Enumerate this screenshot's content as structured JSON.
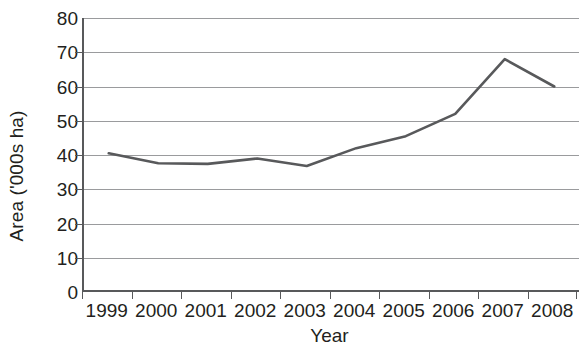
{
  "chart_data": {
    "type": "line",
    "title": "",
    "xlabel": "Year",
    "ylabel": "Area ('000s ha)",
    "categories": [
      "1999",
      "2000",
      "2001",
      "2002",
      "2003",
      "2004",
      "2005",
      "2006",
      "2007",
      "2008"
    ],
    "values": [
      40.5,
      37.6,
      37.4,
      39.0,
      36.8,
      42.0,
      45.5,
      52.0,
      68.0,
      60.0
    ],
    "series": [
      {
        "name": "Area",
        "values": [
          40.5,
          37.6,
          37.4,
          39.0,
          36.8,
          42.0,
          45.5,
          52.0,
          68.0,
          60.0
        ],
        "color": "#58595b"
      }
    ],
    "ylim": [
      0,
      80
    ],
    "y_ticks": [
      0,
      10,
      20,
      30,
      40,
      50,
      60,
      70,
      80
    ],
    "y_tick_labels": [
      "0",
      "10",
      "20",
      "30",
      "40",
      "50",
      "60",
      "70",
      "80"
    ],
    "grid": "horizontal",
    "legend": "none",
    "line_color": "#58595b",
    "gridline_color": "#9a9b9d",
    "axis_color": "#58595b",
    "background_color": "#ffffff",
    "markers": false
  }
}
